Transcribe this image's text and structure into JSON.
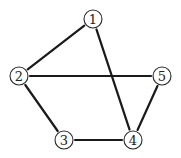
{
  "diagram": {
    "type": "undirected-graph",
    "colors": {
      "edge": "#1a1a1a",
      "node_stroke": "#2a2a2a",
      "node_fill": "#ffffff",
      "label": "#222222",
      "background": "#ffffff"
    },
    "nodes": [
      {
        "id": "1",
        "label": "1",
        "x": 93,
        "y": 19
      },
      {
        "id": "2",
        "label": "2",
        "x": 19,
        "y": 76
      },
      {
        "id": "3",
        "label": "3",
        "x": 64,
        "y": 140
      },
      {
        "id": "4",
        "label": "4",
        "x": 133,
        "y": 140
      },
      {
        "id": "5",
        "label": "5",
        "x": 162,
        "y": 76
      }
    ],
    "edges": [
      {
        "from": "1",
        "to": "2"
      },
      {
        "from": "1",
        "to": "4"
      },
      {
        "from": "2",
        "to": "5"
      },
      {
        "from": "2",
        "to": "3"
      },
      {
        "from": "3",
        "to": "4"
      },
      {
        "from": "4",
        "to": "5"
      }
    ],
    "node_radius": 9
  }
}
